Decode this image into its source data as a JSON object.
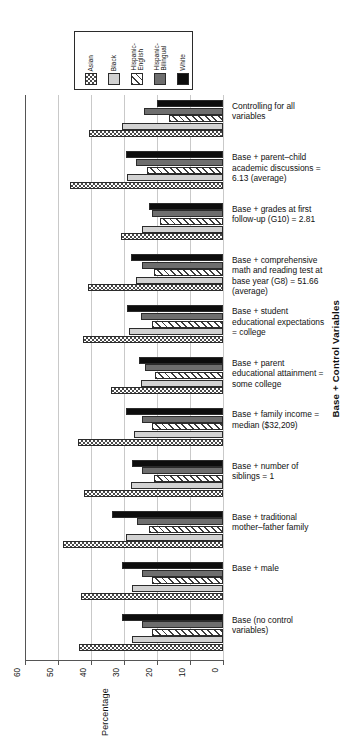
{
  "chart_data": {
    "type": "bar",
    "orientation": "horizontal",
    "title": "",
    "xlabel": "Percentage",
    "ylabel": "Base + Control Variables",
    "xlim": [
      60,
      0
    ],
    "xticks": [
      60,
      50,
      40,
      30,
      20,
      10,
      0
    ],
    "grid": true,
    "legend_position": "top-left",
    "legend_title": "",
    "series": [
      {
        "name": "Asian",
        "pattern": "crosshatch",
        "color": "#ffffff",
        "values": [
          40.5,
          46.5,
          31.0,
          41.0,
          42.5,
          34.0,
          44.0,
          42.0,
          48.5,
          43.0,
          43.5
        ]
      },
      {
        "name": "Black",
        "pattern": "light-gray-solid",
        "color": "#d2d2d2",
        "values": [
          30.5,
          29.0,
          24.5,
          26.5,
          28.5,
          25.0,
          27.0,
          28.0,
          29.5,
          27.5,
          27.5
        ]
      },
      {
        "name": "Hispanic-\nEnglish",
        "pattern": "diagonal-stripes",
        "color": "#ffffff",
        "values": [
          16.5,
          23.0,
          19.0,
          21.0,
          21.5,
          20.5,
          21.5,
          21.0,
          22.5,
          21.5,
          21.5
        ]
      },
      {
        "name": "Hispanic-\nBilingual",
        "pattern": "dark-gray-solid",
        "color": "#6e6e6e",
        "values": [
          24.0,
          26.5,
          21.5,
          24.5,
          25.0,
          23.5,
          24.5,
          24.5,
          26.0,
          24.5,
          24.5
        ]
      },
      {
        "name": "White",
        "pattern": "black-solid",
        "color": "#0d0d0d",
        "values": [
          20.0,
          29.5,
          22.5,
          28.0,
          29.0,
          25.5,
          29.5,
          27.5,
          33.5,
          30.5,
          30.5
        ]
      }
    ],
    "categories": [
      "Controlling for all\nvariables",
      "Base + parent–child\nacademic discussions =\n6.13 (average)",
      "Base + grades at first\nfollow-up (G10) = 2.81",
      "Base + comprehensive\nmath and reading test at\nbase year (G8) = 51.66\n(average)",
      "Base + student\neducational expectations\n= college",
      "Base + parent\neducational attainment =\nsome college",
      "Base + family income =\nmedian ($32,209)",
      "Base + number of\nsiblings = 1",
      "Base + traditional\nmother–father family",
      "Base + male",
      "Base (no control\nvariables)"
    ]
  },
  "legend": {
    "items": [
      {
        "label": "Asian",
        "swatch": "crosshatch-swatch"
      },
      {
        "label": "Black",
        "swatch": "light-gray-swatch"
      },
      {
        "label": "Hispanic-\nEnglish",
        "swatch": "diagonal-stripes-swatch"
      },
      {
        "label": "Hispanic-\nBilingual",
        "swatch": "dark-gray-swatch"
      },
      {
        "label": "White",
        "swatch": "black-swatch"
      }
    ]
  },
  "axes": {
    "x_title": "Percentage",
    "y_title": "Base + Control Variables",
    "x_tick_labels": [
      "60",
      "50",
      "40",
      "30",
      "20",
      "10",
      "0"
    ]
  }
}
